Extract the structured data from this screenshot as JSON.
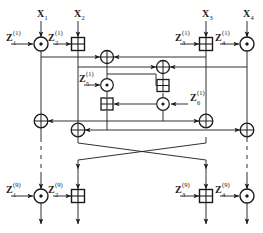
{
  "diagram": {
    "stroke_color": "#1a1a1a",
    "background": "#ffffff",
    "inputs": [
      {
        "id": "x1",
        "label": "X",
        "sub": "1",
        "x": 41
      },
      {
        "id": "x2",
        "label": "X",
        "sub": "2",
        "x": 78
      },
      {
        "id": "x3",
        "label": "X",
        "sub": "3",
        "x": 206
      },
      {
        "id": "x4",
        "label": "X",
        "sub": "4",
        "x": 247
      }
    ],
    "subkeys_round1": [
      {
        "id": "z1",
        "label": "Z",
        "sub": "1",
        "sup": "(1)"
      },
      {
        "id": "z2",
        "label": "Z",
        "sub": "2",
        "sup": "(1)"
      },
      {
        "id": "z3",
        "label": "Z",
        "sub": "3",
        "sup": "(1)"
      },
      {
        "id": "z4",
        "label": "Z",
        "sub": "4",
        "sup": "(1)"
      },
      {
        "id": "z5",
        "label": "Z",
        "sub": "5",
        "sup": "(1)"
      },
      {
        "id": "z6",
        "label": "Z",
        "sub": "6",
        "sup": "(1)"
      }
    ],
    "subkeys_round9": [
      {
        "id": "z1f",
        "label": "Z",
        "sub": "1",
        "sup": "(9)"
      },
      {
        "id": "z2f",
        "label": "Z",
        "sub": "2",
        "sup": "(9)"
      },
      {
        "id": "z3f",
        "label": "Z",
        "sub": "3",
        "sup": "(9)"
      },
      {
        "id": "z4f",
        "label": "Z",
        "sub": "4",
        "sup": "(9)"
      }
    ],
    "operators": [
      {
        "id": "op-mul-1",
        "type": "circle-dot",
        "name": "multiply-mod",
        "x": 41,
        "y": 44
      },
      {
        "id": "op-add-1",
        "type": "square-plus",
        "name": "add-mod",
        "x": 78,
        "y": 44
      },
      {
        "id": "op-add-2",
        "type": "square-plus",
        "name": "add-mod",
        "x": 206,
        "y": 44
      },
      {
        "id": "op-mul-2",
        "type": "circle-dot",
        "name": "multiply-mod",
        "x": 247,
        "y": 44
      },
      {
        "id": "op-xor-1",
        "type": "circle-plus",
        "name": "xor",
        "x": 107,
        "y": 57
      },
      {
        "id": "op-xor-2",
        "type": "circle-plus",
        "name": "xor",
        "x": 163,
        "y": 67
      },
      {
        "id": "op-mul-3",
        "type": "circle-dot",
        "name": "multiply-mod",
        "x": 107,
        "y": 85
      },
      {
        "id": "op-add-3",
        "type": "square-plus",
        "name": "add-mod",
        "x": 163,
        "y": 86
      },
      {
        "id": "op-add-4",
        "type": "square-plus",
        "name": "add-mod",
        "x": 107,
        "y": 104
      },
      {
        "id": "op-mul-4",
        "type": "circle-dot",
        "name": "multiply-mod",
        "x": 163,
        "y": 104
      },
      {
        "id": "op-xor-3",
        "type": "circle-plus",
        "name": "xor",
        "x": 41,
        "y": 121
      },
      {
        "id": "op-xor-4",
        "type": "circle-plus",
        "name": "xor",
        "x": 206,
        "y": 121
      },
      {
        "id": "op-xor-5",
        "type": "circle-plus",
        "name": "xor",
        "x": 78,
        "y": 130
      },
      {
        "id": "op-xor-6",
        "type": "circle-plus",
        "name": "xor",
        "x": 247,
        "y": 130
      },
      {
        "id": "op-mul-5",
        "type": "circle-dot",
        "name": "multiply-mod",
        "x": 41,
        "y": 196
      },
      {
        "id": "op-add-5",
        "type": "square-plus",
        "name": "add-mod",
        "x": 78,
        "y": 196
      },
      {
        "id": "op-add-6",
        "type": "square-plus",
        "name": "add-mod",
        "x": 206,
        "y": 196
      },
      {
        "id": "op-mul-6",
        "type": "circle-dot",
        "name": "multiply-mod",
        "x": 247,
        "y": 196
      }
    ]
  }
}
